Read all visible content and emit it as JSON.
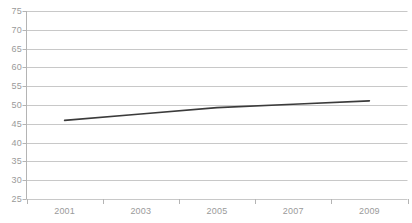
{
  "chart_data": {
    "type": "line",
    "title": "",
    "subtitle": "",
    "xlabel": "",
    "ylabel": "",
    "x": [
      2001,
      2003,
      2005,
      2007,
      2009
    ],
    "categories": [
      "2001",
      "2003",
      "2005",
      "2007",
      "2009"
    ],
    "series": [
      {
        "name": "",
        "values": [
          45.9,
          47.6,
          49.3,
          50.2,
          51.1
        ],
        "color": "#3b3b3b"
      }
    ],
    "xticklabels": [
      "2001",
      "2003",
      "2005",
      "2007",
      "2009"
    ],
    "yticklabels": [
      "25",
      "30",
      "35",
      "40",
      "45",
      "50",
      "55",
      "60",
      "65",
      "70",
      "75"
    ],
    "yticks": [
      25,
      30,
      35,
      40,
      45,
      50,
      55,
      60,
      65,
      70,
      75
    ],
    "ylim": [
      25,
      75
    ],
    "xlim": [
      2000,
      2010
    ],
    "grid": true,
    "grid_axis": "y",
    "grid_color": "#c8c8c8",
    "axis_color": "#b4b4b4",
    "tick_label_color": "#9a9a9a",
    "legend": false,
    "legend_position": "none",
    "background": "#ffffff",
    "annotations": []
  },
  "axes": {
    "y_axis_name": "value-axis",
    "x_axis_name": "year-axis"
  }
}
